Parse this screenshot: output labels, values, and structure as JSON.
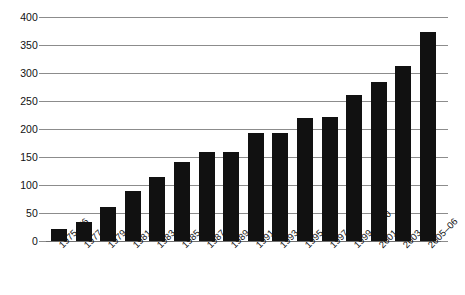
{
  "chart_data": {
    "type": "bar",
    "title": "",
    "subtitle": "",
    "xlabel": "",
    "ylabel": "",
    "categories": [
      "1975–76",
      "1977–78",
      "1979–80",
      "1981–82",
      "1983–84",
      "1985–86",
      "1987–88",
      "1989–90",
      "1991–92",
      "1993–94",
      "1995–96",
      "1997–98",
      "1999–2000",
      "2001–02",
      "2003–04",
      "2005–06"
    ],
    "values": [
      21,
      34,
      61,
      89,
      114,
      141,
      159,
      159,
      193,
      193,
      220,
      222,
      261,
      284,
      313,
      374
    ],
    "ylim": [
      0,
      400
    ],
    "ytick_values": [
      0,
      50,
      100,
      150,
      200,
      250,
      300,
      350,
      400
    ],
    "ytick_labels": [
      "0",
      "50",
      "100",
      "150",
      "200",
      "250",
      "300",
      "350",
      "400"
    ],
    "grid": true,
    "legend": null,
    "legend_position": "none",
    "bar_color": "#111111",
    "grid_color": "#8c8c8c",
    "background_color": "#ffffff",
    "xtick_rotation": -45
  }
}
